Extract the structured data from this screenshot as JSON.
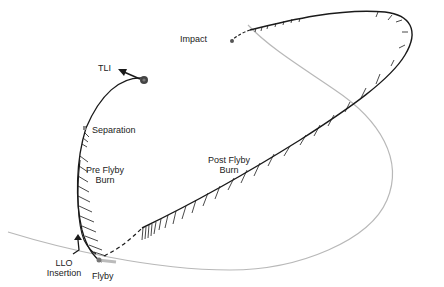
{
  "diagram": {
    "type": "trajectory-diagram",
    "colors": {
      "trajectory": "#1a1a1a",
      "orbit": "#b8b8b8",
      "marker": "#555555",
      "background": "#ffffff"
    },
    "labels": {
      "impact": "Impact",
      "tli": "TLI",
      "separation": "Separation",
      "pre_flyby_burn_line1": "Pre Flyby",
      "pre_flyby_burn_line2": "Burn",
      "post_flyby_burn_line1": "Post Flyby",
      "post_flyby_burn_line2": "Burn",
      "llo_insertion_line1": "LLO",
      "llo_insertion_line2": "Insertion",
      "flyby": "Flyby"
    },
    "icons": {
      "tli_marker": "filled-circle",
      "tli_arrow": "arrow-left",
      "llo_arrow": "arrow-up",
      "impact_marker": "small-dot",
      "flyby_marker": "small-dot"
    }
  }
}
